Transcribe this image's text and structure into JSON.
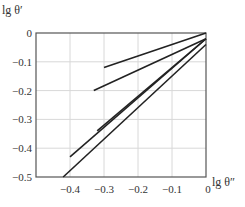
{
  "chart_data": {
    "type": "line",
    "title": "",
    "xlabel": "lg θ″",
    "ylabel": "lg θ′",
    "xlim": [
      -0.5,
      0
    ],
    "ylim": [
      -0.5,
      0
    ],
    "x_ticks": [
      "-0.4",
      "-0.3",
      "-0.2",
      "-0.1",
      "0"
    ],
    "y_ticks": [
      "0",
      "-0.1",
      "-0.2",
      "-0.3",
      "-0.4",
      "-0.5"
    ],
    "grid": true,
    "legend": null,
    "series": [
      {
        "name": "line-1",
        "x": [
          -0.3,
          0
        ],
        "y": [
          -0.12,
          0.0
        ]
      },
      {
        "name": "line-2",
        "x": [
          -0.33,
          0
        ],
        "y": [
          -0.2,
          -0.02
        ]
      },
      {
        "name": "line-3",
        "x": [
          -0.32,
          0
        ],
        "y": [
          -0.34,
          -0.02
        ]
      },
      {
        "name": "line-4",
        "x": [
          -0.4,
          0
        ],
        "y": [
          -0.43,
          -0.02
        ]
      },
      {
        "name": "line-5",
        "x": [
          -0.42,
          0
        ],
        "y": [
          -0.5,
          -0.04
        ]
      }
    ],
    "colors": {
      "line": "#222222",
      "grid": "#d8d8d8",
      "axis": "#555555"
    }
  }
}
